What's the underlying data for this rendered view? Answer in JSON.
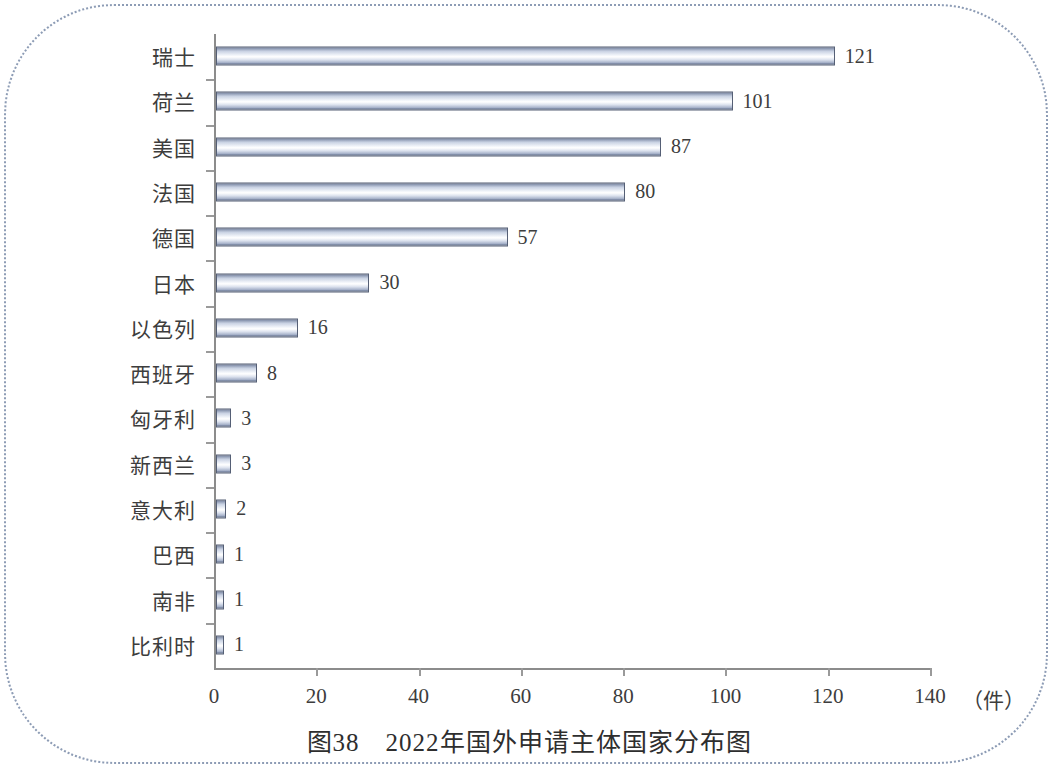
{
  "figure": {
    "caption": "图38　2022年国外申请主体国家分布图",
    "unit_label": "（件）"
  },
  "chart_data": {
    "type": "bar",
    "orientation": "horizontal",
    "title": "图38　2022年国外申请主体国家分布图",
    "xlabel": "（件）",
    "ylabel": "",
    "xlim": [
      0,
      140
    ],
    "grid": false,
    "legend": null,
    "xticks": [
      "0",
      "20",
      "40",
      "60",
      "80",
      "100",
      "120",
      "140"
    ],
    "xtick_values": [
      0,
      20,
      40,
      60,
      80,
      100,
      120,
      140
    ],
    "categories": [
      "瑞士",
      "荷兰",
      "美国",
      "法国",
      "德国",
      "日本",
      "以色列",
      "西班牙",
      "匈牙利",
      "新西兰",
      "意大利",
      "巴西",
      "南非",
      "比利时"
    ],
    "values": [
      121,
      101,
      87,
      80,
      57,
      30,
      16,
      8,
      3,
      3,
      2,
      1,
      1,
      1
    ],
    "value_labels": [
      "121",
      "101",
      "87",
      "80",
      "57",
      "30",
      "16",
      "8",
      "3",
      "3",
      "2",
      "1",
      "1",
      "1"
    ],
    "bar_fill": "#c9d2e3",
    "bar_edge": "#555f75",
    "axis_color": "#8c8c8c",
    "text_color": "#3d3d3d",
    "frame_color": "#8d9cb5",
    "background": "#ffffff"
  }
}
